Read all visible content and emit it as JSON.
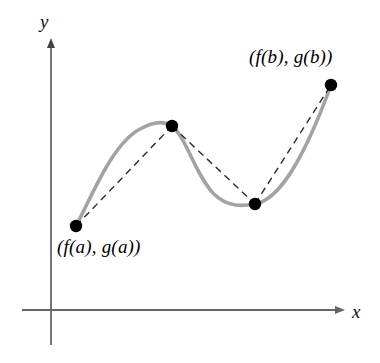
{
  "figure": {
    "background_color": "#ffffff"
  },
  "axes": {
    "x_label": "x",
    "y_label": "y",
    "color": "#666666",
    "x_axis": {
      "x1": 22,
      "y1": 310,
      "x2": 345,
      "y2": 310,
      "arrow": "right"
    },
    "y_axis": {
      "x1": 51,
      "y1": 345,
      "x2": 51,
      "y2": 38,
      "arrow": "up"
    }
  },
  "curve": {
    "name": "parametric-curve",
    "color": "#a3a3a3",
    "width": 3.6,
    "style": "solid",
    "path": "M 76 226 C 92 196, 112 144, 140 129 C 156 120, 166 122, 172 126 C 186 137, 196 176, 214 194 C 228 208, 244 206, 255 204 C 276 200, 300 170, 331 85"
  },
  "chords": {
    "name": "dashed-polygonal-path",
    "color": "#2b2b2b",
    "width": 1.4,
    "dash": "7 5",
    "segments": [
      {
        "x1": 76,
        "y1": 226,
        "x2": 172,
        "y2": 126
      },
      {
        "x1": 172,
        "y1": 126,
        "x2": 255,
        "y2": 204
      },
      {
        "x1": 255,
        "y1": 204,
        "x2": 331,
        "y2": 85
      }
    ]
  },
  "points": [
    {
      "name": "point-start",
      "x": 76,
      "y": 226,
      "r": 6.2,
      "color": "#000000",
      "label": "(f(a), g(a))"
    },
    {
      "name": "point-peak",
      "x": 172,
      "y": 126,
      "r": 6.2,
      "color": "#000000",
      "label": ""
    },
    {
      "name": "point-valley",
      "x": 255,
      "y": 204,
      "r": 6.2,
      "color": "#000000",
      "label": ""
    },
    {
      "name": "point-end",
      "x": 331,
      "y": 85,
      "r": 6.2,
      "color": "#000000",
      "label": "(f(b), g(b))"
    }
  ],
  "labels": {
    "start_point": "(f(a), g(a))",
    "end_point": "(f(b), g(b))"
  },
  "chart_data": {
    "type": "line",
    "title": "",
    "xlabel": "x",
    "ylabel": "y",
    "grid": false,
    "legend": "none",
    "annotations": [
      {
        "text": "(f(a), g(a))",
        "x": 76,
        "y": 226,
        "position": "below-right"
      },
      {
        "text": "(f(b), g(b))",
        "x": 331,
        "y": 85,
        "position": "above-left"
      }
    ],
    "series": [
      {
        "name": "smooth-curve",
        "style": "solid",
        "color": "#a3a3a3",
        "x": [
          76,
          100,
          125,
          150,
          172,
          196,
          216,
          236,
          255,
          280,
          305,
          331
        ],
        "y": [
          226,
          189,
          157,
          133,
          126,
          151,
          180,
          198,
          204,
          193,
          160,
          85
        ]
      },
      {
        "name": "polygonal-approximation",
        "style": "dashed",
        "color": "#2b2b2b",
        "x": [
          76,
          172,
          255,
          331
        ],
        "y": [
          226,
          126,
          204,
          85
        ]
      }
    ]
  }
}
